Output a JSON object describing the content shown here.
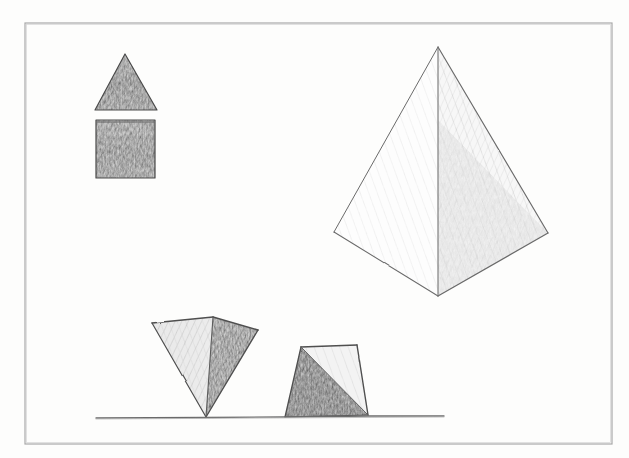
{
  "canvas": {
    "width": 629,
    "height": 458,
    "background_color": "#fdfdfc",
    "medium": "pencil-sketch"
  },
  "frame": {
    "label": "drawing-border",
    "x": 25,
    "y": 23,
    "width": 587,
    "height": 421,
    "stroke_color": "#a9a9a9",
    "stroke_width": 1.2
  },
  "palette": {
    "outline": "#4a4a4a",
    "light_outline": "#7d7d7d",
    "graphite_dark": "#6e6e6e",
    "graphite_mid": "#8e8e8e",
    "graphite_light": "#c9c9c9",
    "graphite_faint": "#e6e6e6",
    "ground_line": "#6b6b6b"
  },
  "shapes": [
    {
      "id": "flat-triangle",
      "name": "shaded-triangle",
      "kind": "2d-triangle",
      "description": "Small equilateral triangle filled with dense graphite shading",
      "points": "125,54 157,110 95,110",
      "fill": "#919191",
      "stroke": "#4a4a4a"
    },
    {
      "id": "flat-square",
      "name": "shaded-square",
      "kind": "2d-square",
      "description": "Small square filled with dense graphite shading",
      "x": 96,
      "y": 120,
      "width": 59,
      "height": 58,
      "fill": "#949494",
      "stroke": "#4a4a4a"
    },
    {
      "id": "large-pyramid",
      "name": "large-square-pyramid",
      "kind": "3d-pyramid",
      "description": "Large upright square pyramid seen from a corner; left face light, right face faintly shaded",
      "apex": "438,47",
      "left_vertex": "334,232",
      "right_vertex": "548,233",
      "front_vertex": "438,296",
      "left_face_fill": "#fcfcfc",
      "right_face_fill": "#f2f2f2",
      "stroke": "#6a6a6a"
    },
    {
      "id": "inverted-pyramid",
      "name": "inverted-pyramid-on-tip",
      "kind": "3d-pyramid-inverted",
      "description": "Upside-down pyramid balancing on its apex on the ground line; right face dark",
      "tip": "206,417",
      "back_top": "213,317",
      "left_top": "152,323",
      "right_top": "258,330",
      "left_face_fill": "#e4e4e4",
      "right_face_fill": "#a3a3a3",
      "stroke": "#4f4f4f"
    },
    {
      "id": "frustum",
      "name": "truncated-pyramid-frustum",
      "kind": "3d-frustum",
      "description": "Truncated pyramid (frustum) resting on the ground line; dark shaded left face, light right face",
      "top_left": "301,347",
      "top_right": "357,345",
      "bottom_left": "285,417",
      "bottom_right": "368,415",
      "dark_face_fill": "#8d8d8d",
      "light_face_fill": "#f0f0f0",
      "stroke": "#4f4f4f"
    }
  ],
  "ground_line": {
    "name": "ground-line",
    "x1": 96,
    "y1": 418,
    "x2": 444,
    "y2": 416,
    "stroke_color": "#6b6b6b",
    "stroke_width": 1.3
  }
}
